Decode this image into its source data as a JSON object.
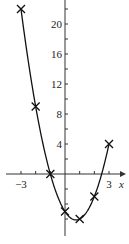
{
  "chart_data": {
    "type": "line",
    "title": "",
    "xlabel": "x",
    "ylabel": "y",
    "function": "y = 2x^2 - 3x - 5",
    "x": [
      -3,
      -2,
      -1,
      0,
      1,
      2,
      3
    ],
    "series": [
      {
        "name": "y = 2x² − 3x − 5",
        "values": [
          22,
          9,
          0,
          -5,
          -6,
          -3,
          4
        ],
        "marker": "x"
      }
    ],
    "xlim": [
      -4.2,
      3.8
    ],
    "ylim": [
      -9,
      23
    ],
    "x_tick_labels": [
      {
        "value": -3,
        "label": "−3"
      },
      {
        "value": 3,
        "label": "3"
      }
    ],
    "y_tick_labels": [
      {
        "value": 4,
        "label": "4"
      },
      {
        "value": 8,
        "label": "8"
      },
      {
        "value": 12,
        "label": "12"
      },
      {
        "value": 16,
        "label": "16"
      },
      {
        "value": 20,
        "label": "20"
      }
    ],
    "x_minor_ticks": [
      -3,
      -2,
      -1,
      1,
      2,
      3
    ],
    "y_minor_ticks": [
      -6,
      -4,
      -2,
      2,
      4,
      6,
      8,
      10,
      12,
      14,
      16,
      18,
      20,
      22
    ],
    "grid": false,
    "legend": "none",
    "colors": {
      "line": "#111111",
      "axes": "#333333",
      "marker": "#111111"
    }
  }
}
